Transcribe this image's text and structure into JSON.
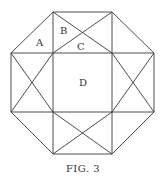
{
  "figure": {
    "caption": "FIG. 3",
    "labels": {
      "a": "A",
      "b": "B",
      "c": "C",
      "d": "D"
    }
  }
}
